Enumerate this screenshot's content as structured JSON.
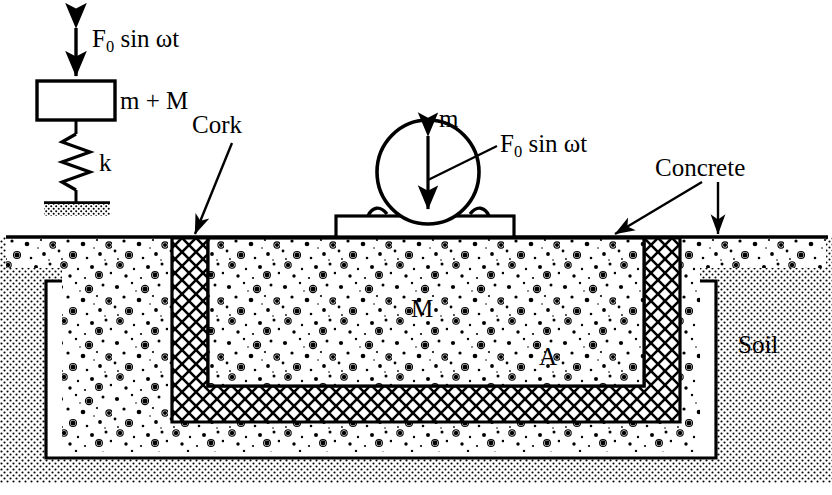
{
  "figure": {
    "colors": {
      "ink": "#000000",
      "paper": "#ffffff",
      "concrete_fill": "#fbfbfb",
      "soil_fill": "#ffffff",
      "cork_fill": "#ffffff"
    }
  },
  "schematic": {
    "excitation_label_html": "F<sub class=\"sub\">0</sub> sin ωt",
    "excitation_label_text": "F0 sin ωt",
    "mass_label_html": "m + M",
    "mass_label_text": "m + M",
    "spring_label": "k",
    "arrow_name": "double-headed-force-arrow",
    "ground_name": "fixed-ground-hatch"
  },
  "machine": {
    "mass_label": "m",
    "excitation_label_html": "F<sub class=\"sub\">0</sub> sin ωt",
    "excitation_label_text": "F0 sin ωt",
    "base_plate_name": "machine-base-plate",
    "body_name": "machine-body-circle"
  },
  "foundation": {
    "block_mass_label": "M",
    "base_area_label": "A",
    "cork_label": "Cork",
    "concrete_label": "Concrete",
    "soil_label": "Soil"
  },
  "annotations": {
    "cork_pointer": "Cork",
    "concrete_pointer_left": "Concrete",
    "concrete_pointer_right": "Concrete",
    "soil_pointer": "Soil"
  }
}
